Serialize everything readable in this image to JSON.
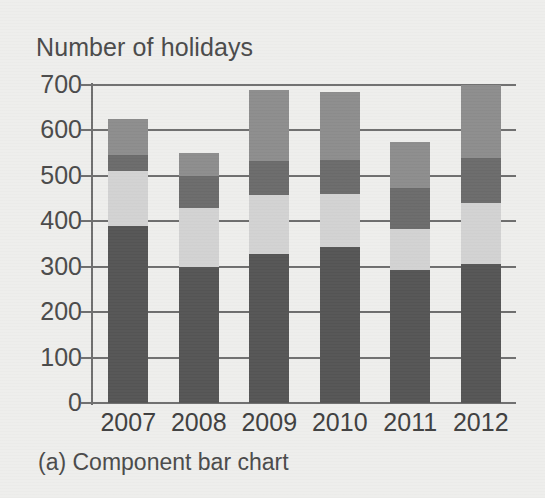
{
  "figure": {
    "title": "Number of holidays",
    "caption": "(a) Component bar chart"
  },
  "chart_data": {
    "type": "bar",
    "subtype": "stacked",
    "title": "Number of holidays",
    "caption": "(a) Component bar chart",
    "xlabel": "",
    "ylabel": "Number of holidays",
    "ylim": [
      0,
      700
    ],
    "ytick_labels": [
      "700",
      "600",
      "500",
      "400",
      "300",
      "200",
      "100",
      "0"
    ],
    "yticks": [
      700,
      600,
      500,
      400,
      300,
      200,
      100,
      0
    ],
    "grid": true,
    "legend": false,
    "categories": [
      "2007",
      "2008",
      "2009",
      "2010",
      "2011",
      "2012"
    ],
    "series": [
      {
        "name": "component-1",
        "color": "#555555",
        "values": [
          390,
          300,
          328,
          343,
          293,
          305
        ]
      },
      {
        "name": "component-2",
        "color": "#d2d2d2",
        "values": [
          120,
          130,
          130,
          117,
          90,
          135
        ]
      },
      {
        "name": "component-3",
        "color": "#6b6b6b",
        "values": [
          35,
          70,
          75,
          75,
          90,
          100
        ]
      },
      {
        "name": "component-4",
        "color": "#8d8d8d",
        "values": [
          80,
          50,
          157,
          150,
          102,
          160
        ]
      }
    ],
    "totals": [
      625,
      550,
      690,
      685,
      575,
      700
    ]
  }
}
